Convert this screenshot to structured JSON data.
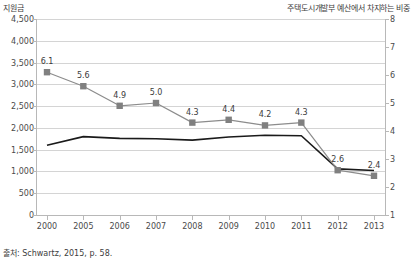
{
  "axes": {
    "left_title": "지원금",
    "right_title": "주택도시개발부 예산에서 차지하는 비중",
    "left_ticks": [
      "0",
      "500",
      "1,000",
      "1,500",
      "2,000",
      "2,500",
      "3,000",
      "3,500",
      "4,000",
      "4,500"
    ],
    "right_ticks": [
      "1",
      "2",
      "3",
      "4",
      "5",
      "6",
      "7",
      "8"
    ],
    "x_ticks": [
      "2000",
      "2005",
      "2006",
      "2007",
      "2008",
      "2009",
      "2010",
      "2011",
      "2012",
      "2013"
    ]
  },
  "source": "출처: Schwartz, 2015, p. 58.",
  "colors": {
    "line_primary": "#1a1a1a",
    "line_secondary": "#8c8c8c",
    "marker": "#808080",
    "gridline": "#d4d4d4",
    "text": "#3d3d3d"
  },
  "chart_data": {
    "type": "line",
    "title": "",
    "xlabel": "",
    "ylabel": "지원금",
    "y2label": "주택도시개발부 예산에서 차지하는 비중",
    "categories": [
      "2000",
      "2005",
      "2006",
      "2007",
      "2008",
      "2009",
      "2010",
      "2011",
      "2012",
      "2013"
    ],
    "ylim": [
      0,
      4500
    ],
    "y2lim": [
      1,
      8
    ],
    "grid": true,
    "legend": "none",
    "series": [
      {
        "name": "지원금",
        "axis": "left",
        "values": [
          1600,
          1800,
          1760,
          1750,
          1720,
          1790,
          1830,
          1820,
          1060,
          1020
        ],
        "labels": [
          "",
          "",
          "",
          "",
          "",
          "",
          "",
          "",
          "",
          ""
        ],
        "color": "#1a1a1a",
        "markers": false
      },
      {
        "name": "주택도시개발부 예산에서 차지하는 비중",
        "axis": "right",
        "values": [
          6.1,
          5.6,
          4.9,
          5.0,
          4.3,
          4.4,
          4.2,
          4.3,
          2.6,
          2.4
        ],
        "labels": [
          "6.1",
          "5.6",
          "4.9",
          "5.0",
          "4.3",
          "4.4",
          "4.2",
          "4.3",
          "2.6",
          "2.4"
        ],
        "color": "#8c8c8c",
        "markers": true
      }
    ]
  }
}
